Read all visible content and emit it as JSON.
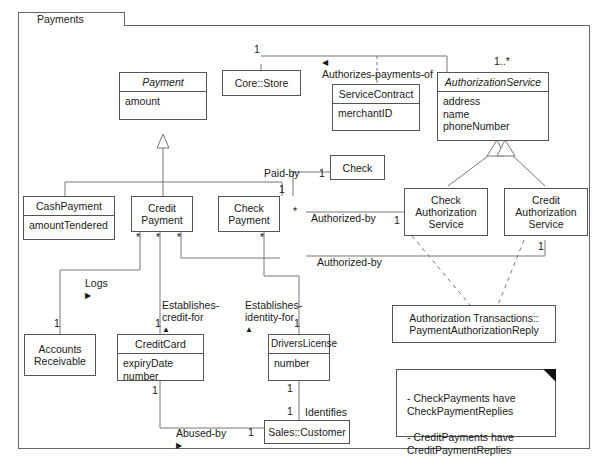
{
  "diagram": {
    "type": "uml-class-diagram",
    "package": {
      "name": "Payments"
    },
    "classes": [
      {
        "id": "payment",
        "name": "Payment",
        "abstract": true,
        "attributes": "amount"
      },
      {
        "id": "core_store",
        "name": "Core::Store",
        "abstract": false,
        "attributes": ""
      },
      {
        "id": "service_contract",
        "name": "ServiceContract",
        "abstract": false,
        "attributes": "merchantID"
      },
      {
        "id": "authorization_service",
        "name": "AuthorizationService",
        "abstract": true,
        "attributes": "address\nname\nphoneNumber"
      },
      {
        "id": "check",
        "name": "Check",
        "abstract": false,
        "attributes": ""
      },
      {
        "id": "cash_payment",
        "name": "CashPayment",
        "abstract": false,
        "attributes": "amountTendered"
      },
      {
        "id": "credit_payment",
        "name": "Credit\nPayment",
        "abstract": false,
        "attributes": ""
      },
      {
        "id": "check_payment",
        "name": "Check\nPayment",
        "abstract": false,
        "attributes": ""
      },
      {
        "id": "check_auth_service",
        "name": "Check\nAuthorization\nService",
        "abstract": false,
        "attributes": ""
      },
      {
        "id": "credit_auth_service",
        "name": "Credit\nAuthorization\nService",
        "abstract": false,
        "attributes": ""
      },
      {
        "id": "accounts_receivable",
        "name": "Accounts\nReceivable",
        "abstract": false,
        "attributes": ""
      },
      {
        "id": "credit_card",
        "name": "CreditCard",
        "abstract": false,
        "attributes": "expiryDate\nnumber"
      },
      {
        "id": "drivers_license",
        "name": "DriversLicense",
        "abstract": false,
        "attributes": "number"
      },
      {
        "id": "sales_customer",
        "name": "Sales::Customer",
        "abstract": false,
        "attributes": ""
      },
      {
        "id": "payment_auth_reply",
        "name": "Authorization Transactions::\nPaymentAuthorizationReply",
        "abstract": false,
        "attributes": ""
      }
    ],
    "association_labels": [
      {
        "id": "authorizes",
        "text": "Authorizes-payments-of",
        "marker": "left-triangle"
      },
      {
        "id": "paid_by",
        "text": "Paid-by",
        "marker": "none"
      },
      {
        "id": "authorized_by_check",
        "text": "Authorized-by",
        "marker": "none"
      },
      {
        "id": "authorized_by_credit",
        "text": "Authorized-by",
        "marker": "none"
      },
      {
        "id": "logs",
        "text": "Logs",
        "marker": "right-triangle"
      },
      {
        "id": "establishes_credit_for",
        "text": "Establishes-\ncredit-for",
        "marker": "up-triangle"
      },
      {
        "id": "establishes_identity_for",
        "text": "Establishes-\nidentity-for",
        "marker": "up-triangle"
      },
      {
        "id": "abused_by",
        "text": "Abused-by",
        "marker": "right-triangle"
      },
      {
        "id": "identifies",
        "text": "Identifies",
        "marker": "none"
      }
    ],
    "multiplicities": [
      {
        "id": "m-store",
        "text": "1"
      },
      {
        "id": "m-auth-many",
        "text": "1..*"
      },
      {
        "id": "m-check-1",
        "text": "1"
      },
      {
        "id": "m-checkpay-paid",
        "text": "1"
      },
      {
        "id": "m-checkpay-auth-star",
        "text": "*"
      },
      {
        "id": "m-checkauth-1",
        "text": "1"
      },
      {
        "id": "m-creditauth-1",
        "text": "1"
      },
      {
        "id": "m-creditpay-s1",
        "text": "*"
      },
      {
        "id": "m-creditpay-s2",
        "text": "*"
      },
      {
        "id": "m-creditpay-s3",
        "text": "*"
      },
      {
        "id": "m-checkpay-star",
        "text": "*"
      },
      {
        "id": "m-accounts-1",
        "text": "1"
      },
      {
        "id": "m-creditcard-1",
        "text": "1"
      },
      {
        "id": "m-creditcard-bottom-1",
        "text": "1"
      },
      {
        "id": "m-license-1",
        "text": "1"
      },
      {
        "id": "m-license-bottom-1",
        "text": "1"
      },
      {
        "id": "m-customer-1",
        "text": "1"
      },
      {
        "id": "m-customer-left-1",
        "text": "1"
      }
    ],
    "note": {
      "text": "- CheckPayments have\n   CheckPaymentReplies\n\n- CreditPayments have\n   CreditPaymentReplies"
    }
  }
}
